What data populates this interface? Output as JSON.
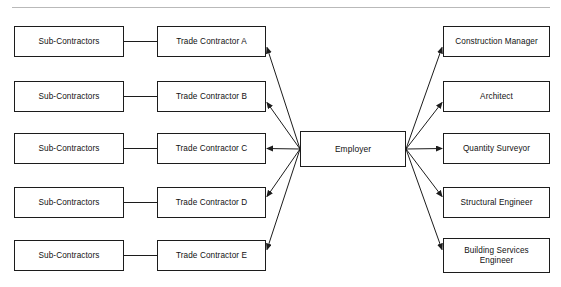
{
  "diagram": {
    "title_partial": "",
    "type": "construction contractual relationship chart",
    "center": {
      "label": "Employer",
      "x": 300,
      "y": 131,
      "w": 106,
      "h": 36
    },
    "left_column": [
      {
        "label": "Sub-Contractors",
        "x": 14,
        "y": 26,
        "w": 110,
        "h": 31
      },
      {
        "label": "Sub-Contractors",
        "x": 14,
        "y": 81,
        "w": 110,
        "h": 31
      },
      {
        "label": "Sub-Contractors",
        "x": 14,
        "y": 133,
        "w": 110,
        "h": 31
      },
      {
        "label": "Sub-Contractors",
        "x": 14,
        "y": 187,
        "w": 110,
        "h": 31
      },
      {
        "label": "Sub-Contractors",
        "x": 14,
        "y": 240,
        "w": 110,
        "h": 31
      }
    ],
    "middle_column": [
      {
        "label": "Trade Contractor A",
        "x": 157,
        "y": 26,
        "w": 109,
        "h": 31
      },
      {
        "label": "Trade Contractor B",
        "x": 157,
        "y": 81,
        "w": 109,
        "h": 31
      },
      {
        "label": "Trade Contractor C",
        "x": 157,
        "y": 133,
        "w": 109,
        "h": 31
      },
      {
        "label": "Trade Contractor D",
        "x": 157,
        "y": 187,
        "w": 109,
        "h": 31
      },
      {
        "label": "Trade Contractor E",
        "x": 157,
        "y": 240,
        "w": 109,
        "h": 31
      }
    ],
    "right_column": [
      {
        "label": "Construction Manager",
        "x": 443,
        "y": 26,
        "w": 107,
        "h": 31
      },
      {
        "label": "Architect",
        "x": 443,
        "y": 81,
        "w": 107,
        "h": 31
      },
      {
        "label": "Quantity Surveyor",
        "x": 443,
        "y": 133,
        "w": 107,
        "h": 31
      },
      {
        "label": "Structural Engineer",
        "x": 443,
        "y": 187,
        "w": 107,
        "h": 31
      },
      {
        "label": "Building Services Engineer",
        "x": 443,
        "y": 238,
        "w": 107,
        "h": 35
      }
    ],
    "connectors": {
      "plain_links": [
        {
          "from": "Sub-Contractors 1",
          "to": "Trade Contractor A"
        },
        {
          "from": "Sub-Contractors 2",
          "to": "Trade Contractor B"
        },
        {
          "from": "Sub-Contractors 3",
          "to": "Trade Contractor C"
        },
        {
          "from": "Sub-Contractors 4",
          "to": "Trade Contractor D"
        },
        {
          "from": "Sub-Contractors 5",
          "to": "Trade Contractor E"
        }
      ],
      "arrows_from_employer": [
        {
          "to": "Trade Contractor A"
        },
        {
          "to": "Trade Contractor B"
        },
        {
          "to": "Trade Contractor C"
        },
        {
          "to": "Trade Contractor D"
        },
        {
          "to": "Trade Contractor E"
        },
        {
          "to": "Construction Manager"
        },
        {
          "to": "Architect"
        },
        {
          "to": "Quantity Surveyor"
        },
        {
          "to": "Structural Engineer"
        },
        {
          "to": "Building Services Engineer"
        }
      ]
    },
    "colors": {
      "stroke": "#1c1c1c",
      "fill": "#ffffff",
      "rule": "#b9b9b9",
      "text": "#111111"
    }
  }
}
